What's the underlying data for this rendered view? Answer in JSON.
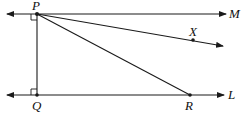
{
  "diagram": {
    "type": "geometry",
    "stroke_color": "#1a1a1a",
    "points": {
      "P": {
        "label": "P",
        "x": 37,
        "y": 14
      },
      "Q": {
        "label": "Q",
        "x": 37,
        "y": 95
      },
      "R": {
        "label": "R",
        "x": 190,
        "y": 95
      },
      "X": {
        "label": "X",
        "x": 193,
        "y": 40
      }
    },
    "lines": {
      "M": {
        "label": "M",
        "description": "line through P, parallel to L"
      },
      "L": {
        "label": "L",
        "description": "line through Q and R"
      }
    },
    "segments": [
      {
        "from": "P",
        "to": "Q",
        "note": "perpendicular to both M and L"
      },
      {
        "from": "P",
        "to": "R"
      }
    ],
    "rays": [
      {
        "from": "P",
        "through": "X"
      }
    ],
    "right_angles": [
      "P",
      "Q"
    ]
  }
}
